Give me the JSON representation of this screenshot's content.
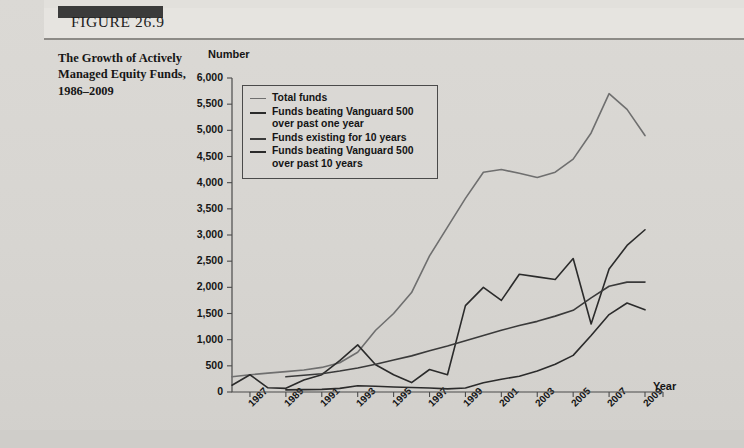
{
  "figure": {
    "number_label": "FIGURE 26.9",
    "caption": "The Growth of Actively Managed Equity Funds, 1986–2009"
  },
  "chart_data": {
    "type": "line",
    "title": "The Growth of Actively Managed Equity Funds, 1986–2009",
    "xlabel": "Year",
    "ylabel": "Number",
    "ylim": [
      0,
      6000
    ],
    "ytick_step": 500,
    "yticks": [
      "0",
      "500",
      "1,000",
      "1,500",
      "2,000",
      "2,500",
      "3,000",
      "3,500",
      "4,000",
      "4,500",
      "5,000",
      "5,500",
      "6,000"
    ],
    "xlim": [
      1986,
      2009
    ],
    "x": [
      1986,
      1987,
      1988,
      1989,
      1990,
      1991,
      1992,
      1993,
      1994,
      1995,
      1996,
      1997,
      1998,
      1999,
      2000,
      2001,
      2002,
      2003,
      2004,
      2005,
      2006,
      2007,
      2008,
      2009
    ],
    "xticks": [
      1987,
      1989,
      1991,
      1993,
      1995,
      1997,
      1999,
      2001,
      2003,
      2005,
      2007,
      2009
    ],
    "xtick_labels": [
      "1987",
      "1989",
      "1991",
      "1993",
      "1995",
      "1997",
      "1999",
      "2001",
      "2003",
      "2005",
      "2007",
      "2009"
    ],
    "grid": false,
    "legend_position": "upper-left-inside",
    "series": [
      {
        "name": "Total funds",
        "color": "#6f6f6f",
        "width": 1.6,
        "values": [
          290,
          330,
          360,
          390,
          420,
          470,
          560,
          760,
          1180,
          1500,
          1900,
          2600,
          3150,
          3700,
          4200,
          4250,
          4180,
          4100,
          4200,
          4450,
          4950,
          5700,
          5400,
          4900
        ]
      },
      {
        "name": "Funds beating Vanguard 500 over past one year",
        "color": "#2b2b2b",
        "width": 1.6,
        "values": [
          130,
          330,
          80,
          70,
          230,
          330,
          600,
          900,
          520,
          330,
          180,
          430,
          330,
          1650,
          2000,
          1750,
          2250,
          2200,
          2150,
          2550,
          1300,
          2350,
          2800,
          3100
        ]
      },
      {
        "name": "Funds existing for 10 years",
        "color": "#3a3a3a",
        "width": 1.6,
        "values": [
          null,
          null,
          null,
          290,
          320,
          350,
          400,
          460,
          530,
          610,
          690,
          790,
          880,
          980,
          1080,
          1180,
          1270,
          1350,
          1450,
          1560,
          1800,
          2020,
          2100,
          2100
        ]
      },
      {
        "name": "Funds beating Vanguard 500 over past 10 years",
        "color": "#2b2b2b",
        "width": 1.6,
        "values": [
          null,
          null,
          null,
          40,
          45,
          50,
          70,
          120,
          110,
          95,
          85,
          75,
          60,
          75,
          175,
          245,
          300,
          400,
          530,
          700,
          1080,
          1480,
          1700,
          1570
        ]
      }
    ]
  },
  "axes": {
    "y_title": "Number",
    "x_title": "Year"
  },
  "legend": {
    "items": [
      {
        "label": "Total funds",
        "color": "#6f6f6f"
      },
      {
        "label": "Funds beating Vanguard 500 over past one year",
        "color": "#2b2b2b"
      },
      {
        "label": "Funds existing for 10 years",
        "color": "#3a3a3a"
      },
      {
        "label": "Funds beating Vanguard 500 over past 10 years",
        "color": "#2b2b2b"
      }
    ]
  }
}
